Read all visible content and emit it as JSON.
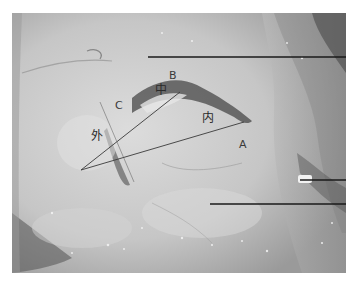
{
  "figure": {
    "style": "grayscale anatomical photograph",
    "labels": {
      "A": "A",
      "B": "B",
      "C": "C",
      "outer": "外",
      "middle": "中",
      "inner": "内"
    },
    "colors": {
      "background": "#ffffff",
      "annotation_line": "#1a1a1a",
      "label_text": "#2a2a2a"
    },
    "pointer_lines": [
      {
        "x1": 148,
        "y1": 57,
        "x2": 346,
        "y2": 57
      },
      {
        "x1": 300,
        "y1": 180,
        "x2": 346,
        "y2": 180
      },
      {
        "x1": 210,
        "y1": 204,
        "x2": 346,
        "y2": 204
      }
    ],
    "angle_lines": [
      {
        "x1": 81,
        "y1": 170,
        "x2": 180,
        "y2": 92
      },
      {
        "x1": 81,
        "y1": 170,
        "x2": 244,
        "y2": 122
      }
    ]
  }
}
